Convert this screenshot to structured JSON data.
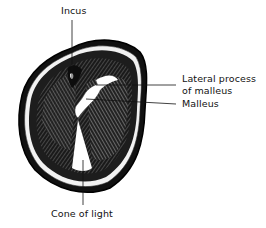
{
  "figure": {
    "labels": {
      "incus": "Incus",
      "lateral_process_line1": "Lateral process",
      "lateral_process_line2": "of malleus",
      "malleus": "Malleus",
      "cone_of_light": "Cone of light"
    }
  }
}
